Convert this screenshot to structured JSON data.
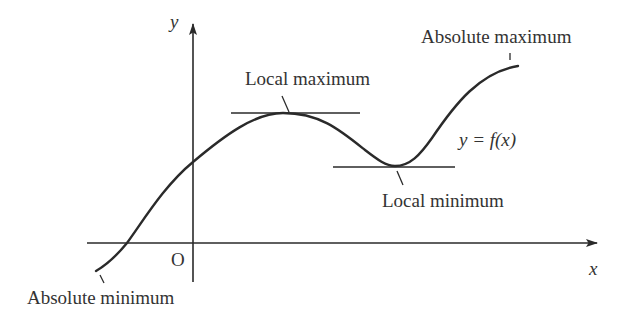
{
  "diagram": {
    "axes": {
      "x_label": "x",
      "y_label": "y",
      "origin_label": "O"
    },
    "curve_label": "y = f(x)",
    "annotations": {
      "local_maximum": "Local maximum",
      "local_minimum": "Local minimum",
      "absolute_maximum": "Absolute maximum",
      "absolute_minimum": "Absolute minimum"
    },
    "colors": {
      "line": "#2a2a2a",
      "text": "#333333",
      "background": "#ffffff"
    }
  }
}
